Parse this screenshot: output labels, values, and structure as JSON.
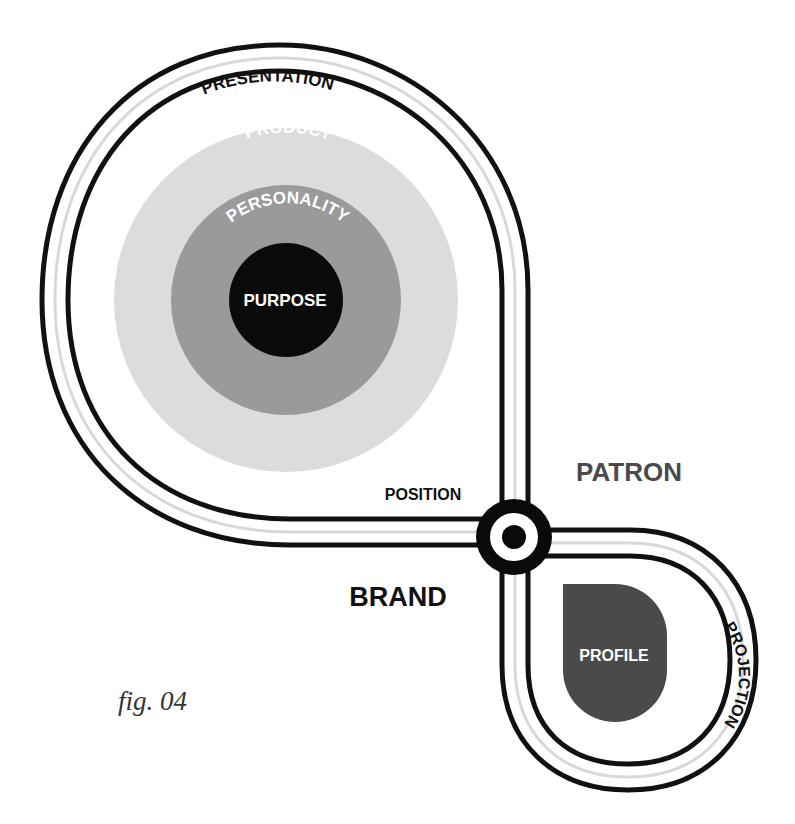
{
  "diagram": {
    "labels": {
      "presentation": "PRESENTATION",
      "product": "PRODUCT",
      "personality": "PERSONALITY",
      "purpose": "PURPOSE",
      "position": "POSITION",
      "patron": "PATRON",
      "brand": "BRAND",
      "profile": "PROFILE",
      "projection": "PROJECTION"
    },
    "caption": "fig. 04"
  },
  "colors": {
    "track": "#111111",
    "track_center": "#d8d8d8",
    "product_ring": "#dcdcdc",
    "personality_ring": "#9a9a9a",
    "purpose_core": "#0a0a0a",
    "profile_drop": "#4a4a4a",
    "patron_text": "#4a4a4a"
  }
}
